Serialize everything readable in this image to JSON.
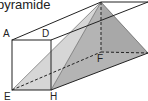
{
  "title": "pyramide",
  "labels": {
    "A": "A",
    "D": "D",
    "E": "E",
    "H": "H",
    "F": "F",
    "G": "G",
    "B": "B",
    "C": "C"
  },
  "colors": {
    "stroke": "#222222",
    "face_light": "#d4d4d4",
    "face_mid": "#bdbdbd",
    "face_dark": "#a9a9a9"
  }
}
